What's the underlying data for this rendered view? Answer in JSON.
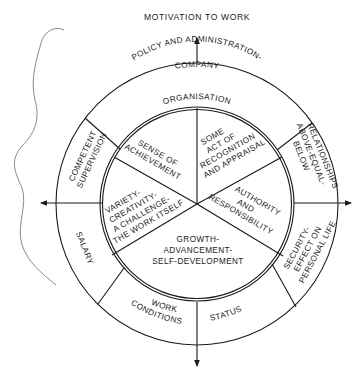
{
  "title": "MOTIVATION TO WORK",
  "outer_ring": {
    "company_policy": [
      "COMPANY",
      "POLICY AND ADMINISTRATION-",
      "ORGANISATION"
    ],
    "relationships": [
      "RELATIONSHIPS",
      "ABOVE-EQUAL-",
      "BELOW"
    ],
    "security": [
      "SECURITY-",
      "EFFECT ON",
      "PERSONAL LIFE"
    ],
    "status": [
      "STATUS"
    ],
    "work_conditions": [
      "WORK",
      "CONDITIONS"
    ],
    "salary": [
      "SALARY"
    ],
    "competent_supervision": [
      "COMPETENT",
      "SUPERVISION"
    ]
  },
  "inner_circle": {
    "sense_of_achievement": [
      "SENSE OF",
      "ACHIEVEMENT"
    ],
    "recognition": [
      "SOME",
      "ACT OF",
      "RECOGNITION",
      "AND APPRAISAL"
    ],
    "authority": [
      "AUTHORITY",
      "AND",
      "RESPONSIBILITY"
    ],
    "growth": [
      "GROWTH-",
      "ADVANCEMENT-",
      "SELF-DEVELOPMENT"
    ],
    "variety": [
      "VARIETY-",
      "CREATIVITY-",
      "A CHALLENGE-",
      "THE WORK ITSELF"
    ]
  }
}
